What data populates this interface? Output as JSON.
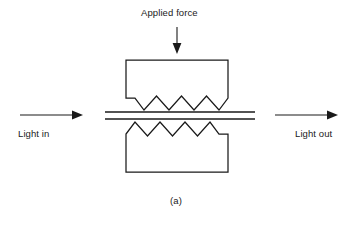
{
  "figure": {
    "caption": "(a)",
    "title_label": "Applied force",
    "light_in_label": "Light in",
    "light_out_label": "Light out",
    "background_color": "#ffffff",
    "line_color": "#1a1a1a"
  },
  "diagram": {
    "type": "microbend-fiber-optic-sensor",
    "components": [
      {
        "name": "upper-deformer-plate",
        "shape": "rectangle-with-chamfered-bottom-corners-and-serrated-bottom-edge",
        "teeth_count": 3,
        "bounds": {
          "x": 126,
          "y": 60,
          "width": 102,
          "height": 52
        }
      },
      {
        "name": "lower-deformer-plate",
        "shape": "rectangle-with-chamfered-top-corners-and-serrated-top-edge",
        "teeth_count": 3,
        "bounds": {
          "x": 126,
          "y": 119,
          "width": 102,
          "height": 53
        }
      },
      {
        "name": "optical-fiber",
        "shape": "two-parallel-horizontal-lines",
        "x_start": 105,
        "x_end": 255,
        "y_top": 112,
        "y_bottom": 119
      },
      {
        "name": "applied-force-arrow",
        "direction": "down",
        "x": 177,
        "y_start": 27,
        "y_end": 53
      },
      {
        "name": "light-in-arrow",
        "direction": "right",
        "y": 115,
        "x_start": 20,
        "x_end": 83
      },
      {
        "name": "light-out-arrow",
        "direction": "right",
        "y": 115,
        "x_start": 275,
        "x_end": 338
      }
    ]
  }
}
